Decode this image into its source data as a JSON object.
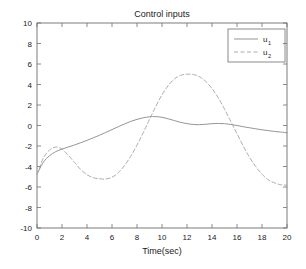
{
  "chart_data": {
    "type": "line",
    "title": "Control inputs",
    "xlabel": "Time(sec)",
    "ylabel": "",
    "xlim": [
      0,
      20
    ],
    "ylim": [
      -10,
      10
    ],
    "xticks": [
      0,
      2,
      4,
      6,
      8,
      10,
      12,
      14,
      16,
      18,
      20
    ],
    "yticks": [
      10,
      8,
      6,
      4,
      2,
      0,
      -2,
      -4,
      -6,
      -8,
      -10
    ],
    "xtick_labels": [
      "0",
      "2",
      "4",
      "6",
      "8",
      "10",
      "12",
      "14",
      "16",
      "18",
      "20"
    ],
    "ytick_labels": [
      "10",
      "8",
      "6",
      "4",
      "2",
      "0",
      "-2",
      "-4",
      "-6",
      "-8",
      "-10"
    ],
    "grid": false,
    "legend_position": "top-right",
    "legend": [
      {
        "label": "u",
        "subscript": "1",
        "style": "solid",
        "color": "#8f8f8f"
      },
      {
        "label": "u",
        "subscript": "2",
        "style": "dashed",
        "color": "#a8a8a8"
      }
    ],
    "series": [
      {
        "name": "u1",
        "label": "u_1",
        "style": "solid",
        "color": "#8f8f8f",
        "x": [
          0,
          0.5,
          1,
          1.5,
          2,
          2.5,
          3,
          3.5,
          4,
          4.5,
          5,
          5.5,
          6,
          6.5,
          7,
          7.5,
          8,
          8.5,
          9,
          9.5,
          10,
          10.5,
          11,
          11.5,
          12,
          12.5,
          13,
          13.5,
          14,
          14.5,
          15,
          15.5,
          16,
          16.5,
          17,
          17.5,
          18,
          18.5,
          19,
          19.5,
          20
        ],
        "y": [
          -4.75,
          -3.6,
          -2.95,
          -2.55,
          -2.3,
          -2.1,
          -1.9,
          -1.68,
          -1.45,
          -1.2,
          -0.95,
          -0.68,
          -0.4,
          -0.12,
          0.15,
          0.4,
          0.6,
          0.75,
          0.85,
          0.87,
          0.8,
          0.65,
          0.48,
          0.3,
          0.18,
          0.1,
          0.08,
          0.12,
          0.18,
          0.2,
          0.18,
          0.1,
          0.0,
          -0.12,
          -0.22,
          -0.32,
          -0.42,
          -0.5,
          -0.58,
          -0.64,
          -0.7
        ]
      },
      {
        "name": "u2",
        "label": "u_2",
        "style": "dashed",
        "color": "#a8a8a8",
        "x": [
          0,
          0.5,
          1,
          1.5,
          2,
          2.5,
          3,
          3.5,
          4,
          4.5,
          5,
          5.5,
          6,
          6.5,
          7,
          7.5,
          8,
          8.5,
          9,
          9.5,
          10,
          10.5,
          11,
          11.5,
          12,
          12.5,
          13,
          13.5,
          14,
          14.5,
          15,
          15.5,
          16,
          16.5,
          17,
          17.5,
          18,
          18.5,
          19,
          19.5,
          20
        ],
        "y": [
          -4.8,
          -3.2,
          -2.4,
          -2.1,
          -2.3,
          -2.9,
          -3.6,
          -4.3,
          -4.8,
          -5.1,
          -5.2,
          -5.22,
          -5.05,
          -4.6,
          -3.9,
          -3.0,
          -1.9,
          -0.7,
          0.6,
          1.85,
          3.0,
          3.9,
          4.55,
          4.9,
          5.0,
          4.98,
          4.75,
          4.3,
          3.6,
          2.7,
          1.6,
          0.4,
          -0.8,
          -2.0,
          -3.1,
          -4.0,
          -4.75,
          -5.3,
          -5.6,
          -5.78,
          -5.82
        ]
      }
    ]
  },
  "axes": {
    "title": "Control inputs",
    "xlabel": "Time(sec)"
  }
}
